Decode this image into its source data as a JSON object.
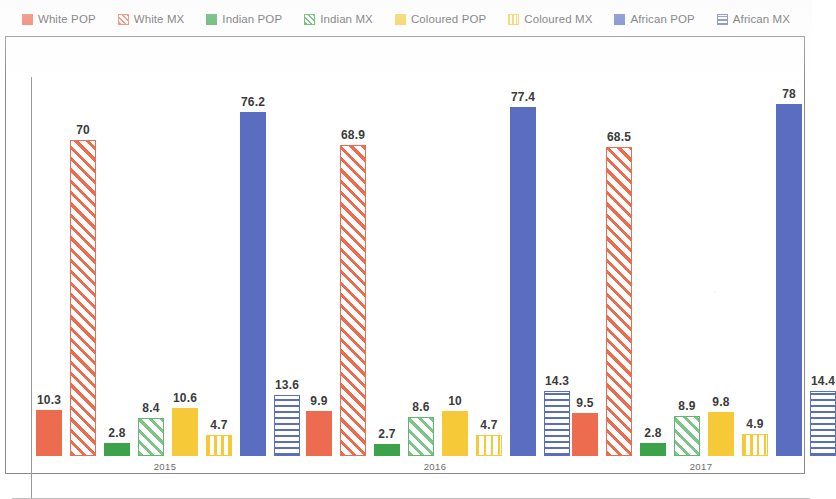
{
  "chart_data": {
    "type": "bar",
    "title": "",
    "subtitle": "",
    "xlabel": "",
    "ylabel": "",
    "categories": [
      "2015",
      "2016",
      "2017"
    ],
    "ylim": [
      0,
      85
    ],
    "grid": false,
    "legend_position": "top",
    "series": [
      {
        "name": "White POP",
        "key": "white-pop",
        "color": "#ED6B4E",
        "pattern": "solid",
        "values": [
          10.3,
          9.9,
          9.5
        ]
      },
      {
        "name": "White MX",
        "key": "white-mx",
        "color": "#ED6B4E",
        "pattern": "diagonal",
        "values": [
          70,
          68.9,
          68.5
        ]
      },
      {
        "name": "Indian POP",
        "key": "indian-pop",
        "color": "#3CA34A",
        "pattern": "solid",
        "values": [
          2.8,
          2.7,
          2.8
        ]
      },
      {
        "name": "Indian MX",
        "key": "indian-mx",
        "color": "#3CA34A",
        "pattern": "diagonal",
        "values": [
          8.4,
          8.6,
          8.9
        ]
      },
      {
        "name": "Coloured POP",
        "key": "coloured-pop",
        "color": "#F6C938",
        "pattern": "solid",
        "values": [
          10.6,
          10,
          9.8
        ]
      },
      {
        "name": "Coloured MX",
        "key": "coloured-mx",
        "color": "#F6C938",
        "pattern": "vertical",
        "values": [
          4.7,
          4.7,
          4.9
        ]
      },
      {
        "name": "African POP",
        "key": "african-pop",
        "color": "#5B6DC0",
        "pattern": "solid",
        "values": [
          76.2,
          77.4,
          78
        ]
      },
      {
        "name": "African MX",
        "key": "african-mx",
        "color": "#5B6DC0",
        "pattern": "horizontal",
        "values": [
          13.6,
          14.3,
          14.4
        ]
      }
    ],
    "value_labels": {
      "2015": [
        "10.3",
        "70",
        "2.8",
        "8.4",
        "10.6",
        "4.7",
        "76.2",
        "13.6"
      ],
      "2016": [
        "9.9",
        "68.9",
        "2.7",
        "8.6",
        "10",
        "4.7",
        "77.4",
        "14.3"
      ],
      "2017": [
        "9.5",
        "68.5",
        "2.8",
        "8.9",
        "9.8",
        "4.9",
        "78",
        "14.4"
      ]
    }
  },
  "legend": {
    "items": [
      {
        "label": "White POP",
        "swatch": "sw-white-pop",
        "icon": "legend-swatch-solid-orange"
      },
      {
        "label": "White MX",
        "swatch": "sw-white-mx",
        "icon": "legend-swatch-hatched-orange"
      },
      {
        "label": "Indian POP",
        "swatch": "sw-indian-pop",
        "icon": "legend-swatch-solid-green"
      },
      {
        "label": "Indian MX",
        "swatch": "sw-indian-mx",
        "icon": "legend-swatch-hatched-green"
      },
      {
        "label": "Coloured POP",
        "swatch": "sw-coloured-pop",
        "icon": "legend-swatch-solid-yellow"
      },
      {
        "label": "Coloured MX",
        "swatch": "sw-coloured-mx",
        "icon": "legend-swatch-striped-yellow"
      },
      {
        "label": "African POP",
        "swatch": "sw-african-pop",
        "icon": "legend-swatch-solid-blue"
      },
      {
        "label": "African MX",
        "swatch": "sw-african-mx",
        "icon": "legend-swatch-striped-blue"
      }
    ]
  },
  "axis": {
    "tick_labels": [
      "2015",
      "2016",
      "2017"
    ]
  },
  "colors": {
    "white": "#ED6B4E",
    "indian": "#3CA34A",
    "coloured": "#F6C938",
    "african": "#5B6DC0",
    "frame": "#8a8a8a",
    "label_text": "#3b3b3b"
  }
}
